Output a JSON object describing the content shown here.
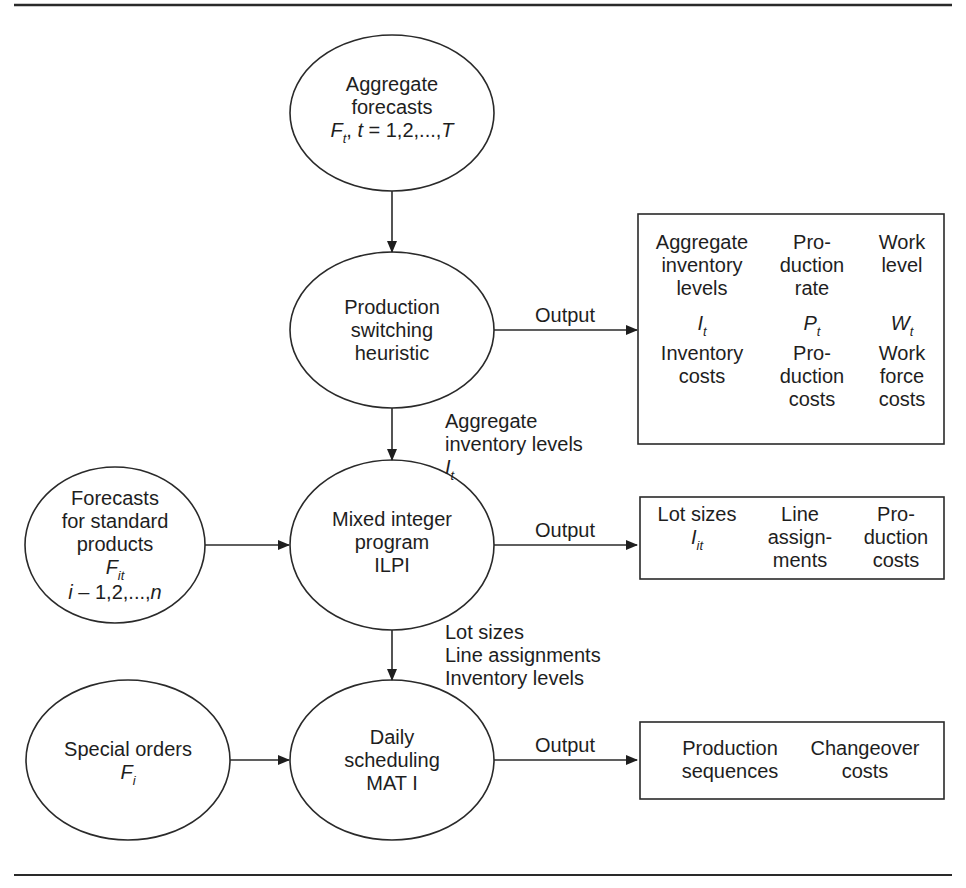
{
  "rules": {
    "top_y": 14,
    "bottom_y": 875
  },
  "nodes": {
    "aggregate_forecasts": {
      "lines": [
        "Aggregate",
        "forecasts"
      ],
      "formula": {
        "symbol": "F",
        "sub": "t",
        "rest_prefix": ", ",
        "var": "t",
        "rest": " = 1,2,...,",
        "end": "T"
      }
    },
    "production_switching": {
      "lines": [
        "Production",
        "switching",
        "heuristic"
      ]
    },
    "mixed_integer": {
      "lines": [
        "Mixed integer",
        "program",
        "ILPI"
      ]
    },
    "forecasts_standard": {
      "lines": [
        "Forecasts",
        "for standard",
        "products"
      ],
      "symbol": "F",
      "sub": "it",
      "range_var": "i",
      "range_text": " – 1,2,...,",
      "range_end": "n"
    },
    "daily_scheduling": {
      "lines": [
        "Daily",
        "scheduling",
        "MAT I"
      ]
    },
    "special_orders": {
      "lines": [
        "Special orders"
      ],
      "symbol": "F",
      "sub": "i"
    }
  },
  "edges": {
    "output_label": "Output",
    "agg_inv_label": {
      "lines": [
        "Aggregate",
        "inventory levels"
      ],
      "symbol": "I",
      "sub": "t"
    },
    "lot_label": {
      "lines": [
        "Lot sizes",
        "Line assignments",
        "Inventory levels"
      ]
    }
  },
  "boxes": {
    "switching_output": {
      "columns": [
        {
          "top": [
            "Aggregate",
            "inventory",
            "levels"
          ],
          "symbol": "I",
          "sub": "t",
          "bottom": [
            "Inventory",
            "costs"
          ]
        },
        {
          "top": [
            "Pro-",
            "duction",
            "rate"
          ],
          "symbol": "P",
          "sub": "t",
          "bottom": [
            "Pro-",
            "duction",
            "costs"
          ]
        },
        {
          "top": [
            "Work",
            "level"
          ],
          "symbol": "W",
          "sub": "t",
          "bottom": [
            "Work",
            "force",
            "costs"
          ]
        }
      ]
    },
    "ilpi_output": {
      "columns": [
        {
          "lines": [
            "Lot sizes"
          ],
          "symbol": "I",
          "sub": "it"
        },
        {
          "lines": [
            "Line",
            "assign-",
            "ments"
          ]
        },
        {
          "lines": [
            "Pro-",
            "duction",
            "costs"
          ]
        }
      ]
    },
    "mat_output": {
      "columns": [
        {
          "lines": [
            "Production",
            "sequences"
          ]
        },
        {
          "lines": [
            "Changeover",
            "costs"
          ]
        }
      ]
    }
  },
  "colors": {
    "stroke": "#2a2a2a",
    "text": "#1e1e1e",
    "background": "#ffffff"
  }
}
